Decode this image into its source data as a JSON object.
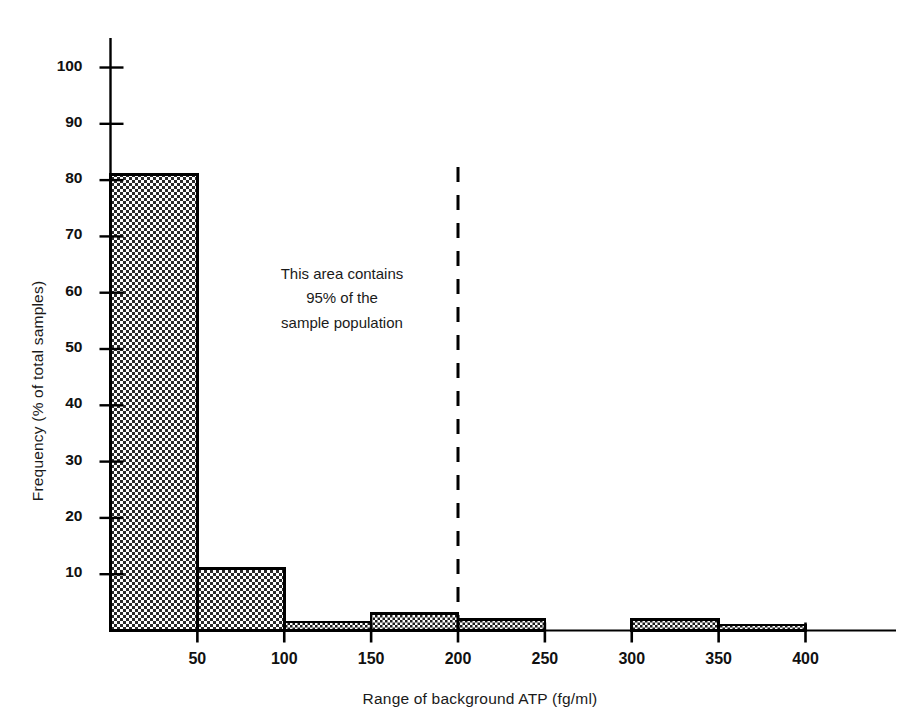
{
  "chart_data": {
    "type": "bar",
    "title": "",
    "subtitle": "",
    "xlabel": "Range of background ATP (fg/ml)",
    "ylabel": "Frequency (% of total samples)",
    "xlim": [
      0,
      450
    ],
    "ylim": [
      0,
      105
    ],
    "grid": false,
    "legend": "none",
    "bin_width": 50,
    "x_tick_labels": [
      "50",
      "100",
      "150",
      "200",
      "250",
      "300",
      "350",
      "400"
    ],
    "x_tick_values": [
      50,
      100,
      150,
      200,
      250,
      300,
      350,
      400
    ],
    "y_tick_labels": [
      "10",
      "20",
      "30",
      "40",
      "50",
      "60",
      "70",
      "80",
      "90",
      "100"
    ],
    "y_tick_values": [
      10,
      20,
      30,
      40,
      50,
      60,
      70,
      80,
      90,
      100
    ],
    "categories": [
      "0-50",
      "50-100",
      "100-150",
      "150-200",
      "200-250",
      "250-300",
      "300-350",
      "350-400"
    ],
    "bin_starts": [
      0,
      50,
      100,
      150,
      200,
      250,
      300,
      350
    ],
    "bin_ends": [
      50,
      100,
      150,
      200,
      250,
      300,
      350,
      400
    ],
    "values": [
      81,
      11,
      1.5,
      3,
      2,
      0,
      2,
      1
    ],
    "series": [
      {
        "name": "Frequency (% of total samples)",
        "values": [
          81,
          11,
          1.5,
          3,
          2,
          0,
          2,
          1
        ]
      }
    ],
    "annotations": [
      {
        "name": "cutoff-line",
        "type": "vertical-dashed-line",
        "x": 200,
        "label": ""
      },
      {
        "name": "area-note",
        "type": "text",
        "lines": [
          "This area contains",
          "95% of the",
          "sample population"
        ]
      }
    ]
  },
  "axes": {
    "y_label": "Frequency (% of total samples)",
    "x_label": "Range of background ATP (fg/ml)",
    "y_ticks": [
      {
        "label": "100",
        "value": 100
      },
      {
        "label": "90",
        "value": 90
      },
      {
        "label": "80",
        "value": 80
      },
      {
        "label": "70",
        "value": 70
      },
      {
        "label": "60",
        "value": 60
      },
      {
        "label": "50",
        "value": 50
      },
      {
        "label": "40",
        "value": 40
      },
      {
        "label": "30",
        "value": 30
      },
      {
        "label": "20",
        "value": 20
      },
      {
        "label": "10",
        "value": 10
      }
    ],
    "x_ticks": [
      {
        "label": "50",
        "value": 50
      },
      {
        "label": "100",
        "value": 100
      },
      {
        "label": "150",
        "value": 150
      },
      {
        "label": "200",
        "value": 200
      },
      {
        "label": "250",
        "value": 250
      },
      {
        "label": "300",
        "value": 300
      },
      {
        "label": "350",
        "value": 350
      },
      {
        "label": "400",
        "value": 400
      }
    ]
  },
  "annotation": {
    "line1": "This area contains",
    "line2": "95% of the",
    "line3": "sample population"
  },
  "colors": {
    "ink": "#000000",
    "background": "#ffffff",
    "fill_dot": "#1a1a1a",
    "fill_base": "#ffffff"
  }
}
